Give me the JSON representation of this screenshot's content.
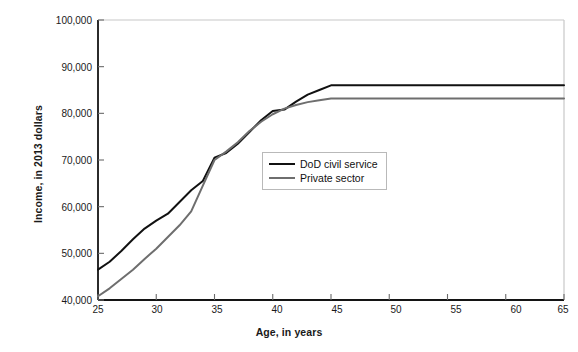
{
  "chart_data": {
    "type": "line",
    "title": "",
    "xlabel": "Age, in years",
    "ylabel": "Income, in 2013 dollars",
    "xlim": [
      25,
      65
    ],
    "ylim": [
      40000,
      100000
    ],
    "xticks": [
      25,
      30,
      35,
      40,
      45,
      50,
      55,
      60,
      65
    ],
    "xticklabels": [
      "25",
      "30",
      "35",
      "40",
      "45",
      "50",
      "55",
      "60",
      "65"
    ],
    "yticks": [
      40000,
      50000,
      60000,
      70000,
      80000,
      90000,
      100000
    ],
    "yticklabels": [
      "40,000",
      "50,000",
      "60,000",
      "70,000",
      "80,000",
      "90,000",
      "100,000"
    ],
    "grid": false,
    "legend_position": "center",
    "x": [
      25,
      26,
      27,
      28,
      29,
      30,
      31,
      32,
      33,
      34,
      35,
      36,
      37,
      38,
      39,
      40,
      41,
      42,
      43,
      44,
      45,
      50,
      55,
      60,
      65
    ],
    "series": [
      {
        "name": "DoD civil service",
        "color": "#111111",
        "width": 2.0,
        "values": [
          46500,
          48200,
          50500,
          53000,
          55300,
          57000,
          58500,
          61000,
          63500,
          65500,
          70500,
          71500,
          73500,
          76000,
          78500,
          80500,
          80800,
          82500,
          84000,
          85000,
          86000,
          86000,
          86000,
          86000,
          86000
        ]
      },
      {
        "name": "Private sector",
        "color": "#6e6e6e",
        "width": 2.0,
        "values": [
          40800,
          42500,
          44500,
          46500,
          48800,
          51000,
          53500,
          56000,
          59000,
          64500,
          70000,
          71800,
          73800,
          76200,
          78200,
          79800,
          81000,
          81800,
          82400,
          82800,
          83200,
          83200,
          83200,
          83200,
          83200
        ]
      }
    ],
    "legend": [
      {
        "label": "DoD civil service",
        "color": "#111111"
      },
      {
        "label": "Private sector",
        "color": "#6e6e6e"
      }
    ],
    "axis_color": "#141414",
    "frame_color": "#c8c8c8",
    "background": "#ffffff"
  }
}
